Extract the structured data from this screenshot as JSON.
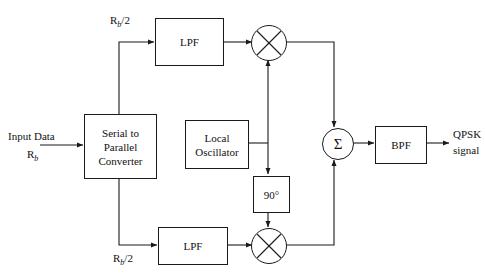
{
  "diagram": {
    "blocks": {
      "serial_to_parallel": {
        "line1": "Serial to",
        "line2": "Parallel",
        "line3": "Converter"
      },
      "lpf_top": {
        "label": "LPF"
      },
      "lpf_bottom": {
        "label": "LPF"
      },
      "local_oscillator": {
        "line1": "Local",
        "line2": "Oscillator"
      },
      "phase_shift": {
        "label": "90°"
      },
      "bpf": {
        "label": "BPF"
      },
      "summer": {
        "symbol": "Σ"
      },
      "mixer_top": {
        "symbol": "⊗"
      },
      "mixer_bottom": {
        "symbol": "⊗"
      }
    },
    "labels": {
      "input_data": "Input Data",
      "input_rate_base": "R",
      "input_rate_sub": "b",
      "branch_top_base": "R",
      "branch_top_sub": "b",
      "branch_top_div": "/2",
      "branch_bottom_base": "R",
      "branch_bottom_sub": "b",
      "branch_bottom_div": "/2",
      "output_line1": "QPSK",
      "output_line2": "signal"
    },
    "colors": {
      "line": "#1a1a1a",
      "text": "#111111",
      "background": "#ffffff"
    }
  }
}
